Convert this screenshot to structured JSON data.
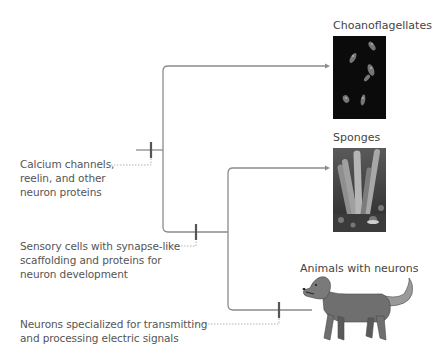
{
  "diagram": {
    "type": "cladogram",
    "taxa": [
      {
        "name": "Choanoflagellates",
        "image": "choanoflagellate-micrograph"
      },
      {
        "name": "Sponges",
        "image": "sponge-photo"
      },
      {
        "name": "Animals with neurons",
        "image": "dog-illustration"
      }
    ],
    "traits": [
      {
        "lines": [
          "Calcium channels,",
          "reelin, and other",
          "neuron proteins"
        ]
      },
      {
        "lines": [
          "Sensory cells with synapse-like",
          "scaffolding and proteins for",
          "neuron development"
        ]
      },
      {
        "lines": [
          "Neurons specialized for transmitting",
          "and processing electric signals"
        ]
      }
    ],
    "colors": {
      "branch": "#8a8a8a",
      "tick": "#555555",
      "text": "#555555",
      "choano_bg": "#0b0b0b"
    }
  }
}
